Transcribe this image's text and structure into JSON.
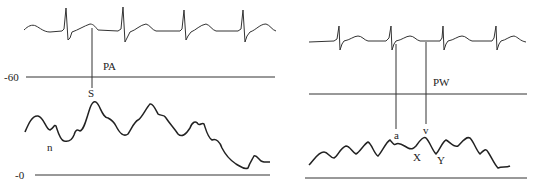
{
  "figure": {
    "left_panel": {
      "ecg_label": "",
      "pressure_label": "PA",
      "axis_labels": {
        "upper": "-60",
        "lower": "-0"
      },
      "markers": [
        {
          "label": "S",
          "description": "systolic peak"
        },
        {
          "label": "n",
          "description": "dicrotic notch"
        }
      ]
    },
    "right_panel": {
      "pressure_label": "PW",
      "markers": [
        {
          "label": "a",
          "description": "a wave"
        },
        {
          "label": "v",
          "description": "v wave"
        },
        {
          "label": "X",
          "description": "x descent"
        },
        {
          "label": "Y",
          "description": "y descent"
        }
      ]
    },
    "colors": {
      "trace": "#222222",
      "background": "#ffffff"
    }
  }
}
